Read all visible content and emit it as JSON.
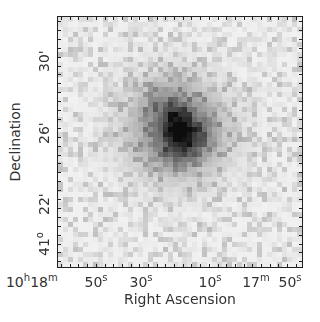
{
  "chart_data": {
    "type": "heatmap",
    "title": "",
    "subtitle": "Greyscale sky image of an extended galaxy centred in the field (darker = brighter emission)",
    "xlabel": "Right Ascension",
    "ylabel": "Declination",
    "x_tick_labels": [
      {
        "main": "10",
        "sup": "h",
        "pos": 18
      },
      {
        "main": " 18",
        "sup": "m",
        "pos": 44
      },
      {
        "main": " 50",
        "sup": "s",
        "pos": 96
      },
      {
        "main": "30",
        "sup": "s",
        "pos": 141
      },
      {
        "main": "10",
        "sup": "s",
        "pos": 210
      },
      {
        "main": "17",
        "sup": "m",
        "pos": 256
      },
      {
        "main": "50",
        "sup": "s",
        "pos": 290
      }
    ],
    "y_tick_labels": [
      {
        "main": "30'",
        "sup": "",
        "pos": 62
      },
      {
        "main": "26'",
        "sup": "",
        "pos": 134
      },
      {
        "main": "22'",
        "sup": "",
        "pos": 205
      },
      {
        "main": "41",
        "sup": "o",
        "pos": 246
      }
    ],
    "x_axis": {
      "unit": "RA (hms)",
      "range_label": "10h 18m 55s to 10h 17m 47s (approx.)",
      "major_ticks_seconds": [
        50,
        30,
        10,
        -10
      ]
    },
    "y_axis": {
      "unit": "Dec (arcmin)",
      "range_label": "41d 19' to 41d 33' (approx.)",
      "major_ticks": [
        "41° 22'",
        "41° 26'",
        "41° 30'"
      ]
    },
    "grid": false,
    "legend": null,
    "colormap": "inverted greyscale",
    "image": {
      "pixels_x": 49,
      "pixels_y": 50,
      "background_level": 0.06,
      "noise_level": 0.07,
      "source": {
        "center_px": [
          23.5,
          22
        ],
        "radius_px": 12,
        "peak": 0.85,
        "features": [
          {
            "name": "bright core knot",
            "center_px": [
              23.5,
              20.5
            ],
            "radius_px": 2.2,
            "amp": 0.35
          },
          {
            "name": "southern core knot",
            "center_px": [
              24,
              25
            ],
            "radius_px": 2.5,
            "amp": 0.35
          },
          {
            "name": "eastern arm",
            "center_px": [
              27.5,
              23
            ],
            "radius_px": 2.2,
            "amp": 0.18
          },
          {
            "name": "north arm",
            "center_px": [
              21,
              17
            ],
            "radius_px": 3,
            "amp": 0.12
          }
        ]
      }
    }
  },
  "axes": {
    "xlabel": "Right Ascension",
    "ylabel": "Declination"
  }
}
